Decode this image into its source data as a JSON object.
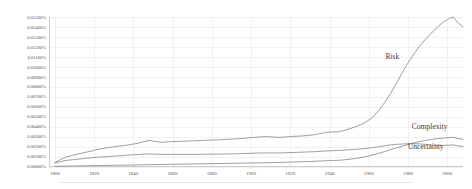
{
  "chart_data": {
    "type": "line",
    "title": "",
    "subtitle": "",
    "xlabel": "",
    "ylabel": "",
    "grid": "both",
    "legend_position": "inline-right",
    "xlim": [
      1797,
      2008
    ],
    "ylim": [
      0.0,
      0.015
    ],
    "x_tick_labels": [
      "1800",
      "1820",
      "1840",
      "1860",
      "1880",
      "1900",
      "1920",
      "1940",
      "1960",
      "1980",
      "2000"
    ],
    "x_ticks": [
      1800,
      1820,
      1840,
      1860,
      1880,
      1900,
      1920,
      1940,
      1960,
      1980,
      2000
    ],
    "y_tick_labels": [
      "0.01500%",
      "0.01400%",
      "0.01300%",
      "0.01200%",
      "0.01100%",
      "0.01000%",
      "0.00900%",
      "0.00800%",
      "0.00700%",
      "0.00600%",
      "0.00500%",
      "0.00400%",
      "0.00300%",
      "0.00200%",
      "0.00100%",
      "0.00000%"
    ],
    "y_ticks": [
      0.015,
      0.014,
      0.013,
      0.012,
      0.011,
      0.01,
      0.009,
      0.008,
      0.007,
      0.006,
      0.005,
      0.004,
      0.003,
      0.002,
      0.001,
      0.0
    ],
    "line_color": "#8c8c8c",
    "grid_color": "#e9e9e9",
    "axis_color": "#bfbfbf",
    "label_color": "#595959",
    "x": [
      1800,
      1803,
      1806,
      1809,
      1812,
      1815,
      1818,
      1821,
      1824,
      1827,
      1830,
      1833,
      1836,
      1839,
      1842,
      1845,
      1848,
      1851,
      1854,
      1857,
      1860,
      1863,
      1866,
      1869,
      1872,
      1875,
      1878,
      1881,
      1884,
      1887,
      1890,
      1893,
      1896,
      1899,
      1902,
      1905,
      1908,
      1911,
      1914,
      1917,
      1920,
      1923,
      1926,
      1929,
      1932,
      1935,
      1938,
      1941,
      1944,
      1947,
      1950,
      1953,
      1956,
      1959,
      1962,
      1965,
      1968,
      1971,
      1974,
      1977,
      1980,
      1983,
      1986,
      1989,
      1992,
      1995,
      1998,
      2001,
      2003,
      2005,
      2008
    ],
    "series": [
      {
        "name": "Risk",
        "label": "Risk",
        "label_x": 1972,
        "label_y": 0.0108,
        "values": [
          0.0004,
          0.00072,
          0.00098,
          0.00112,
          0.00126,
          0.0014,
          0.00152,
          0.00168,
          0.00178,
          0.0019,
          0.00198,
          0.00206,
          0.00212,
          0.00222,
          0.00232,
          0.00248,
          0.00262,
          0.00252,
          0.00242,
          0.00246,
          0.0025,
          0.00252,
          0.00254,
          0.00256,
          0.00258,
          0.00262,
          0.00264,
          0.00266,
          0.00268,
          0.00272,
          0.00274,
          0.00278,
          0.00282,
          0.00288,
          0.00292,
          0.00298,
          0.003,
          0.00296,
          0.00292,
          0.00296,
          0.003,
          0.00304,
          0.00306,
          0.00312,
          0.00318,
          0.0033,
          0.00342,
          0.00346,
          0.00348,
          0.0036,
          0.00378,
          0.00396,
          0.0042,
          0.00452,
          0.00496,
          0.0056,
          0.0064,
          0.0073,
          0.0083,
          0.0094,
          0.0104,
          0.0113,
          0.0121,
          0.0128,
          0.0134,
          0.014,
          0.0145,
          0.01485,
          0.015,
          0.0145,
          0.014
        ]
      },
      {
        "name": "Complexity",
        "label": "Complexity",
        "label_x": 1991,
        "label_y": 0.00372,
        "values": [
          2e-05,
          3e-05,
          4e-05,
          5e-05,
          6e-05,
          7e-05,
          8e-05,
          9e-05,
          0.0001,
          0.00011,
          0.00012,
          0.00013,
          0.00014,
          0.00015,
          0.00016,
          0.00017,
          0.00018,
          0.00019,
          0.0002,
          0.00021,
          0.00022,
          0.00023,
          0.00024,
          0.00025,
          0.00026,
          0.00027,
          0.00028,
          0.00029,
          0.0003,
          0.00031,
          0.00032,
          0.00033,
          0.00034,
          0.00035,
          0.00036,
          0.00037,
          0.00038,
          0.00039,
          0.0004,
          0.00042,
          0.00044,
          0.00046,
          0.00048,
          0.0005,
          0.00052,
          0.00055,
          0.00058,
          0.0006,
          0.00062,
          0.00066,
          0.00072,
          0.0008,
          0.0009,
          0.00102,
          0.00116,
          0.00132,
          0.0015,
          0.00168,
          0.00186,
          0.00204,
          0.0022,
          0.00236,
          0.0025,
          0.00262,
          0.00272,
          0.0028,
          0.00286,
          0.0029,
          0.00292,
          0.00282,
          0.00272
        ]
      },
      {
        "name": "Uncertainty",
        "label": "Uncertainty",
        "label_x": 1989,
        "label_y": 0.00178,
        "values": [
          0.00036,
          0.0005,
          0.00062,
          0.00068,
          0.00074,
          0.0008,
          0.00086,
          0.00092,
          0.00096,
          0.001,
          0.00104,
          0.00108,
          0.00112,
          0.00116,
          0.0012,
          0.00124,
          0.00126,
          0.00124,
          0.00122,
          0.00122,
          0.00122,
          0.00122,
          0.00122,
          0.00122,
          0.00122,
          0.00122,
          0.00124,
          0.00124,
          0.00124,
          0.00126,
          0.00126,
          0.00128,
          0.0013,
          0.00132,
          0.00134,
          0.00136,
          0.00136,
          0.00136,
          0.00136,
          0.00138,
          0.0014,
          0.00142,
          0.00144,
          0.00146,
          0.00148,
          0.00152,
          0.00156,
          0.00158,
          0.0016,
          0.00164,
          0.00168,
          0.00172,
          0.00176,
          0.00182,
          0.0019,
          0.00198,
          0.00208,
          0.00216,
          0.00222,
          0.00226,
          0.00228,
          0.00228,
          0.00226,
          0.00222,
          0.00218,
          0.00214,
          0.00212,
          0.00214,
          0.00216,
          0.00208,
          0.002
        ]
      }
    ]
  }
}
